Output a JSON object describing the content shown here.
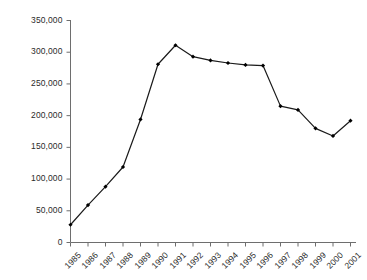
{
  "chart_data": {
    "type": "line",
    "title": "",
    "subtitle": "",
    "xlabel": "",
    "ylabel": "",
    "categories": [
      "1985",
      "1986",
      "1987",
      "1988",
      "1989",
      "1990",
      "1991",
      "1992",
      "1993",
      "1994",
      "1995",
      "1996",
      "1997",
      "1998",
      "1999",
      "2000",
      "2001"
    ],
    "values": [
      28000,
      59000,
      88000,
      119000,
      194000,
      281000,
      311000,
      293000,
      287000,
      283000,
      280000,
      279000,
      215000,
      209000,
      180000,
      168000,
      192000
    ],
    "series": [
      {
        "name": "",
        "values": [
          28000,
          59000,
          88000,
          119000,
          194000,
          281000,
          311000,
          293000,
          287000,
          283000,
          280000,
          279000,
          215000,
          209000,
          180000,
          168000,
          192000
        ]
      }
    ],
    "ylim": [
      0,
      350000
    ],
    "yticks": [
      0,
      50000,
      100000,
      150000,
      200000,
      250000,
      300000,
      350000
    ],
    "ytick_labels": [
      "0",
      "50,000",
      "100,000",
      "150,000",
      "200,000",
      "250,000",
      "300,000",
      "350,000"
    ],
    "xtick_labels": [
      "1985",
      "1986",
      "1987",
      "1988",
      "1989",
      "1990",
      "1991",
      "1992",
      "1993",
      "1994",
      "1995",
      "1996",
      "1997",
      "1998",
      "1999",
      "2000",
      "2001"
    ],
    "grid": false,
    "legend": false,
    "legend_position": "none",
    "marker": "filled-diamond",
    "line_color": "#1a1a1a",
    "marker_color": "#000000",
    "axis_color": "#6e6e6e",
    "text_color": "#2b2b2b",
    "background_color": "#ffffff",
    "annotations": []
  }
}
